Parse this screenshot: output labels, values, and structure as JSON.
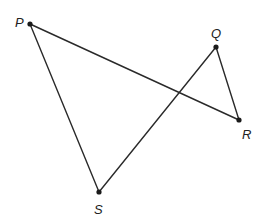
{
  "diagram": {
    "points": [
      {
        "name": "P",
        "x": 30,
        "y": 24,
        "label_x": 15,
        "label_y": 27
      },
      {
        "name": "Q",
        "x": 216,
        "y": 47,
        "label_x": 211,
        "label_y": 38
      },
      {
        "name": "R",
        "x": 239,
        "y": 120,
        "label_x": 242,
        "label_y": 139
      },
      {
        "name": "S",
        "x": 99,
        "y": 192,
        "label_x": 94,
        "label_y": 214
      }
    ],
    "segments": [
      {
        "from": "P",
        "to": "R"
      },
      {
        "from": "P",
        "to": "S"
      },
      {
        "from": "Q",
        "to": "R"
      },
      {
        "from": "Q",
        "to": "S"
      }
    ],
    "labels": {
      "P": "P",
      "Q": "Q",
      "R": "R",
      "S": "S"
    }
  }
}
